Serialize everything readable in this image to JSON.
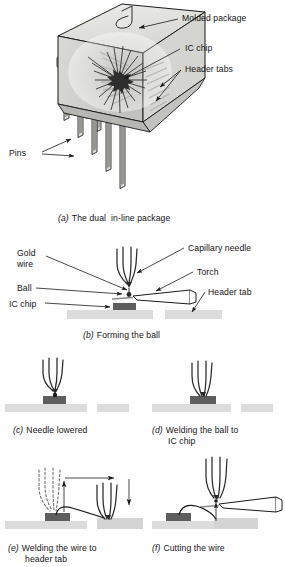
{
  "figure": {
    "title_implicit": "Integrated circuit dual in-line package and wire bonding sequence",
    "panels": [
      {
        "id": "a",
        "marker": "(a)",
        "caption": "The dual  in-line package",
        "callouts": [
          {
            "name": "molded-package",
            "text": "Molded package"
          },
          {
            "name": "ic-chip",
            "text": "IC chip"
          },
          {
            "name": "header-tabs",
            "text": "Header tabs"
          },
          {
            "name": "pins",
            "text": "Pins"
          }
        ]
      },
      {
        "id": "b",
        "marker": "(b)",
        "caption": "Forming the ball",
        "callouts": [
          {
            "name": "gold-wire",
            "text": "Gold\nwire"
          },
          {
            "name": "ball",
            "text": "Ball"
          },
          {
            "name": "ic-chip",
            "text": "IC chip"
          },
          {
            "name": "capillary-needle",
            "text": "Capillary needle"
          },
          {
            "name": "torch",
            "text": "Torch"
          },
          {
            "name": "header-tab",
            "text": "Header tab"
          }
        ]
      },
      {
        "id": "c",
        "marker": "(c)",
        "caption": "Needle lowered",
        "callouts": []
      },
      {
        "id": "d",
        "marker": "(d)",
        "caption": "Welding the ball to\n    IC chip",
        "caption_line1": "Welding the ball to",
        "caption_line2": "IC chip",
        "callouts": []
      },
      {
        "id": "e",
        "marker": "(e)",
        "caption": "Welding the wire to\n    header tab",
        "caption_line1": "Welding the wire to",
        "caption_line2": "header tab",
        "callouts": []
      },
      {
        "id": "f",
        "marker": "(f)",
        "caption": "Cutting the wire",
        "callouts": []
      }
    ]
  },
  "colors": {
    "ink": "#1a1a1a",
    "package_light": "#e8e8e6",
    "package_mid": "#d2d2cf",
    "package_shadow": "#bcbcb8",
    "substrate": "#dcdcdc",
    "chip_dark": "#5e5e5e",
    "paper": "#fefefe"
  }
}
